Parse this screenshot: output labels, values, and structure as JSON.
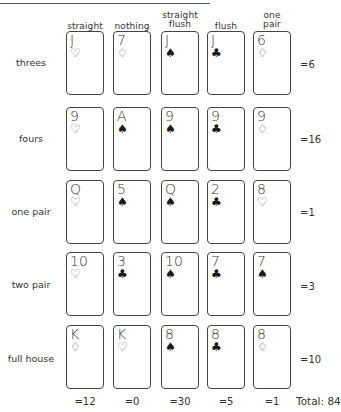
{
  "columns": [
    {
      "label_lines": [
        "",
        "straight"
      ],
      "score": "=12"
    },
    {
      "label_lines": [
        "",
        "nothing"
      ],
      "score": "=0"
    },
    {
      "label_lines": [
        "straight",
        "flush"
      ],
      "score": "=30"
    },
    {
      "label_lines": [
        "",
        "flush"
      ],
      "score": "=5"
    },
    {
      "label_lines": [
        "one",
        "pair"
      ],
      "score": "=1"
    }
  ],
  "rows": [
    {
      "label": "threes",
      "score": "=6",
      "cards": [
        {
          "rank": "J",
          "suit": "♡",
          "color": "red"
        },
        {
          "rank": "7",
          "suit": "♢",
          "color": "red"
        },
        {
          "rank": "J",
          "suit": "♠",
          "color": "black"
        },
        {
          "rank": "J",
          "suit": "♣",
          "color": "black"
        },
        {
          "rank": "6",
          "suit": "♢",
          "color": "red"
        }
      ]
    },
    {
      "label": "fours",
      "score": "=16",
      "cards": [
        {
          "rank": "9",
          "suit": "♡",
          "color": "red"
        },
        {
          "rank": "A",
          "suit": "♠",
          "color": "black"
        },
        {
          "rank": "9",
          "suit": "♠",
          "color": "black"
        },
        {
          "rank": "9",
          "suit": "♣",
          "color": "black"
        },
        {
          "rank": "9",
          "suit": "♢",
          "color": "red"
        }
      ]
    },
    {
      "label": "one pair",
      "score": "=1",
      "cards": [
        {
          "rank": "Q",
          "suit": "♡",
          "color": "red"
        },
        {
          "rank": "5",
          "suit": "♠",
          "color": "black"
        },
        {
          "rank": "Q",
          "suit": "♠",
          "color": "black"
        },
        {
          "rank": "2",
          "suit": "♣",
          "color": "black"
        },
        {
          "rank": "8",
          "suit": "♡",
          "color": "red"
        }
      ]
    },
    {
      "label": "two pair",
      "score": "=3",
      "cards": [
        {
          "rank": "10",
          "suit": "♡",
          "color": "red"
        },
        {
          "rank": "3",
          "suit": "♣",
          "color": "black"
        },
        {
          "rank": "10",
          "suit": "♠",
          "color": "black"
        },
        {
          "rank": "7",
          "suit": "♣",
          "color": "black"
        },
        {
          "rank": "7",
          "suit": "♠",
          "color": "black"
        }
      ]
    },
    {
      "label": "full house",
      "score": "=10",
      "cards": [
        {
          "rank": "K",
          "suit": "♢",
          "color": "red"
        },
        {
          "rank": "K",
          "suit": "♡",
          "color": "red"
        },
        {
          "rank": "8",
          "suit": "♠",
          "color": "black"
        },
        {
          "rank": "8",
          "suit": "♣",
          "color": "black"
        },
        {
          "rank": "8",
          "suit": "♢",
          "color": "red"
        }
      ]
    }
  ],
  "total_label": "Total: 84"
}
